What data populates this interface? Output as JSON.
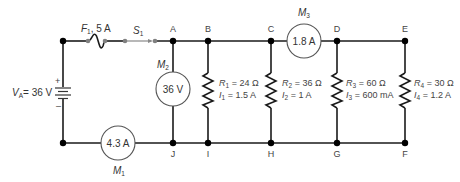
{
  "diagram": {
    "type": "series-parallel circuit",
    "source": {
      "label": "V",
      "subscript": "A",
      "value": "= 36 V",
      "plus": "+",
      "minus": "–"
    },
    "fuse": {
      "label": "F",
      "subscript": "1",
      "rating": ", 5 A"
    },
    "switch": {
      "label": "S",
      "subscript": "1"
    },
    "nodes": [
      "A",
      "B",
      "C",
      "D",
      "E",
      "F",
      "G",
      "H",
      "I",
      "J"
    ],
    "meters": [
      {
        "name": "M",
        "subscript": "1",
        "reading": "4.3 A"
      },
      {
        "name": "M",
        "subscript": "2",
        "reading": "36 V"
      },
      {
        "name": "M",
        "subscript": "3",
        "reading": "1.8 A"
      }
    ],
    "resistors": [
      {
        "r_label": "R",
        "r_sub": "1",
        "r_value": " = 24 Ω",
        "i_label": "I",
        "i_sub": "1",
        "i_value": " = 1.5 A"
      },
      {
        "r_label": "R",
        "r_sub": "2",
        "r_value": " = 36 Ω",
        "i_label": "I",
        "i_sub": "2",
        "i_value": " = 1 A"
      },
      {
        "r_label": "R",
        "r_sub": "3",
        "r_value": " = 60 Ω",
        "i_label": "I",
        "i_sub": "3",
        "i_value": " = 600 mA"
      },
      {
        "r_label": "R",
        "r_sub": "4",
        "r_value": " = 30 Ω",
        "i_label": "I",
        "i_sub": "4",
        "i_value": " = 1.2 A"
      }
    ]
  }
}
